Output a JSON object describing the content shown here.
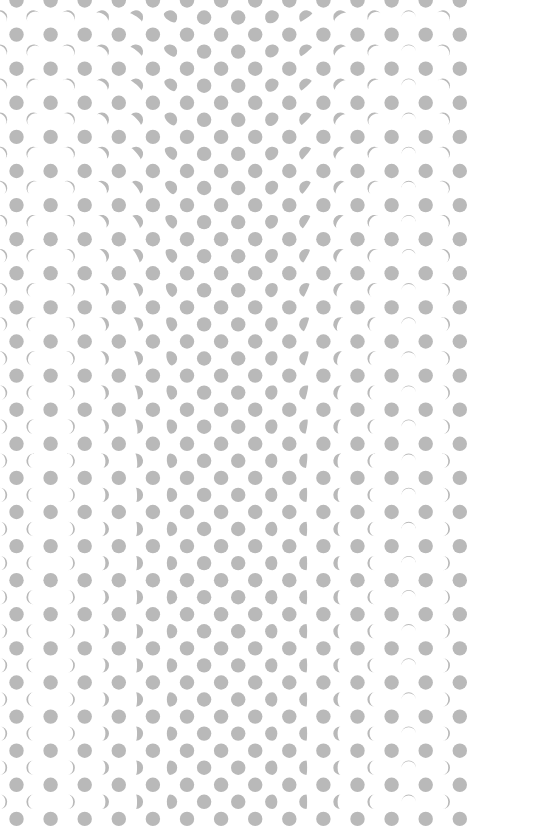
{
  "illusion": {
    "background_color": "#ffffff",
    "dot_color": "#b9b9b9",
    "dot_radius": 7.2,
    "spacing": 34.1,
    "full_grid": {
      "origin_x": 16.5,
      "origin_y": 0.5,
      "columns": 14,
      "rows": 25
    },
    "phase_grid": {
      "origin_x": 33.6,
      "origin_y": 17.5,
      "columns": 13,
      "rows": 24,
      "column_phases": [
        {
          "lit": 0.12,
          "side": "left"
        },
        {
          "lit": 0.12,
          "side": "right"
        },
        {
          "lit": 0.25,
          "side": "right"
        },
        {
          "lit": 0.42,
          "side": "right"
        },
        {
          "lit": 0.72,
          "side": "right"
        },
        {
          "lit": 1.0,
          "side": "full"
        },
        {
          "lit": 1.0,
          "side": "full"
        },
        {
          "lit": 0.85,
          "side": "left"
        },
        {
          "lit": 0.55,
          "side": "left"
        },
        {
          "lit": 0.3,
          "side": "left"
        },
        {
          "lit": 0.15,
          "side": "left"
        },
        {
          "lit": 0.06,
          "side": "top"
        },
        {
          "lit": 0.12,
          "side": "right"
        }
      ],
      "tilt_top_deg": -55,
      "tilt_bottom_deg": 0
    },
    "edge_fragment_column_x": 0
  }
}
